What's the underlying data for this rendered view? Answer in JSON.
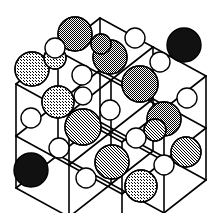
{
  "figure": {
    "background_color": "#ffffff",
    "bond_color": "#000000",
    "bond_width": 1.6,
    "outline_color": "#000000",
    "outline_width": 1.4,
    "projection": {
      "origin_x": 16,
      "origin_y": 84,
      "axis_a_dx": 53,
      "axis_a_dy": 29,
      "axis_b_dx": 0,
      "axis_b_dy": 52,
      "axis_c_dx": 42,
      "axis_c_dy": -33,
      "grid_n": 3
    },
    "palette": {
      "black": "#111111",
      "dark_gray": "#6e6e6e",
      "mid_gray": "#8c8c8c",
      "light_gray": "#b4b4b4",
      "white": "#ffffff"
    },
    "atom_types": [
      {
        "id": "large",
        "role": "anion",
        "radius": 16.5
      },
      {
        "id": "small",
        "role": "cation",
        "radius": 9.5
      }
    ],
    "shade_legend": [
      {
        "name": "black",
        "color": "#111111",
        "count": 3
      },
      {
        "name": "dark-gray",
        "color": "#6e6e6e",
        "count": 5
      },
      {
        "name": "mid-gray",
        "color": "#8c8c8c",
        "count": 4
      },
      {
        "name": "light-gray",
        "color": "#b4b4b4",
        "count": 6
      },
      {
        "name": "white",
        "color": "#ffffff",
        "count": 36
      }
    ],
    "atoms": [
      {
        "n": "atom-large-1",
        "cx": 32,
        "cy": 69,
        "r": 17,
        "fill": "#b4b4b4",
        "kind": "large",
        "shade": "light-gray"
      },
      {
        "n": "atom-large-2",
        "cx": 75,
        "cy": 34,
        "r": 17,
        "fill": "#6e6e6e",
        "kind": "large",
        "shade": "dark-gray"
      },
      {
        "n": "atom-large-3",
        "cx": 184,
        "cy": 45,
        "r": 17,
        "fill": "#111111",
        "kind": "large",
        "shade": "black"
      },
      {
        "n": "atom-large-4",
        "cx": 110,
        "cy": 57,
        "r": 17,
        "fill": "#6e6e6e",
        "kind": "large",
        "shade": "dark-gray"
      },
      {
        "n": "atom-large-5",
        "cx": 140,
        "cy": 84,
        "r": 18,
        "fill": "#6e6e6e",
        "kind": "large",
        "shade": "dark-gray"
      },
      {
        "n": "atom-large-6",
        "cx": 58,
        "cy": 102,
        "r": 16,
        "fill": "#b4b4b4",
        "kind": "large",
        "shade": "light-gray"
      },
      {
        "n": "atom-large-7",
        "cx": 164,
        "cy": 119,
        "r": 17,
        "fill": "#6e6e6e",
        "kind": "large",
        "shade": "dark-gray"
      },
      {
        "n": "atom-large-8",
        "cx": 83,
        "cy": 127,
        "r": 18,
        "fill": "#8c8c8c",
        "kind": "large",
        "shade": "mid-gray"
      },
      {
        "n": "atom-large-9",
        "cx": 186,
        "cy": 152,
        "r": 15,
        "fill": "#8c8c8c",
        "kind": "large",
        "shade": "mid-gray"
      },
      {
        "n": "atom-large-10",
        "cx": 112,
        "cy": 162,
        "r": 17,
        "fill": "#8c8c8c",
        "kind": "large",
        "shade": "mid-gray"
      },
      {
        "n": "atom-large-11",
        "cx": 31,
        "cy": 170,
        "r": 17,
        "fill": "#111111",
        "kind": "large",
        "shade": "black"
      },
      {
        "n": "atom-large-12",
        "cx": 141,
        "cy": 186,
        "r": 16,
        "fill": "#b4b4b4",
        "kind": "large",
        "shade": "light-gray"
      },
      {
        "n": "atom-large-13",
        "cx": 55,
        "cy": 58,
        "r": 11,
        "fill": "#b4b4b4",
        "kind": "large",
        "shade": "light-gray"
      },
      {
        "n": "atom-large-14",
        "cx": 155,
        "cy": 130,
        "r": 11,
        "fill": "#8c8c8c",
        "kind": "large",
        "shade": "mid-gray"
      },
      {
        "n": "atom-large-15",
        "cx": 101,
        "cy": 44,
        "r": 10,
        "fill": "#6e6e6e",
        "kind": "large",
        "shade": "dark-gray"
      },
      {
        "n": "atom-small-1",
        "cx": 55,
        "cy": 48,
        "r": 10,
        "fill": "#ffffff",
        "kind": "small",
        "shade": "white"
      },
      {
        "n": "atom-small-2",
        "cx": 135,
        "cy": 38,
        "r": 10,
        "fill": "#ffffff",
        "kind": "small",
        "shade": "white"
      },
      {
        "n": "atom-small-3",
        "cx": 82,
        "cy": 75,
        "r": 10,
        "fill": "#ffffff",
        "kind": "small",
        "shade": "white"
      },
      {
        "n": "atom-small-4",
        "cx": 160,
        "cy": 62,
        "r": 10,
        "fill": "#ffffff",
        "kind": "small",
        "shade": "white"
      },
      {
        "n": "atom-small-5",
        "cx": 110,
        "cy": 110,
        "r": 10,
        "fill": "#ffffff",
        "kind": "small",
        "shade": "white"
      },
      {
        "n": "atom-small-6",
        "cx": 31,
        "cy": 118,
        "r": 10,
        "fill": "#ffffff",
        "kind": "small",
        "shade": "white"
      },
      {
        "n": "atom-small-7",
        "cx": 187,
        "cy": 98,
        "r": 10,
        "fill": "#ffffff",
        "kind": "small",
        "shade": "white"
      },
      {
        "n": "atom-small-8",
        "cx": 136,
        "cy": 138,
        "r": 10,
        "fill": "#ffffff",
        "kind": "small",
        "shade": "white"
      },
      {
        "n": "atom-small-9",
        "cx": 59,
        "cy": 148,
        "r": 10,
        "fill": "#ffffff",
        "kind": "small",
        "shade": "white"
      },
      {
        "n": "atom-small-10",
        "cx": 164,
        "cy": 165,
        "r": 10,
        "fill": "#ffffff",
        "kind": "small",
        "shade": "white"
      },
      {
        "n": "atom-small-11",
        "cx": 86,
        "cy": 178,
        "r": 10,
        "fill": "#ffffff",
        "kind": "small",
        "shade": "white"
      },
      {
        "n": "atom-small-12",
        "cx": 83,
        "cy": 96,
        "r": 9,
        "fill": "#ffffff",
        "kind": "small",
        "shade": "white"
      }
    ]
  }
}
